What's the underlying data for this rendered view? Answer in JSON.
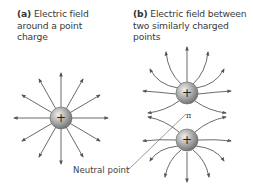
{
  "panel_a": {
    "tag": "(a)",
    "caption": "Electric field around a point charge",
    "caption_lines": [
      "Electric field",
      "around a point",
      "charge"
    ],
    "charge_sign": "+"
  },
  "panel_b": {
    "tag": "(b)",
    "caption": "Electric field between two similarly charged points",
    "caption_lines": [
      "Electric field between",
      "two similarly charged points"
    ],
    "charge_signs": [
      "+",
      "+"
    ],
    "neutral_point_marker": "π"
  },
  "labels": {
    "neutral_point": "Neutral point"
  },
  "colors": {
    "field_line": "#555555",
    "charge_light": "#e6e6e6",
    "charge_dark": "#7a7a7a",
    "text": "#3a3a3a"
  }
}
